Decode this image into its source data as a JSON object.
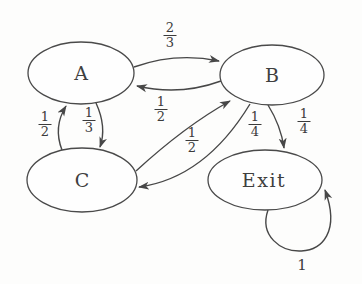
{
  "diagram": {
    "type": "markov-chain-state-diagram",
    "background_color": "#fdfdfc",
    "ink_color": "#474747",
    "nodes": [
      {
        "id": "A",
        "label": "A"
      },
      {
        "id": "B",
        "label": "B"
      },
      {
        "id": "C",
        "label": "C"
      },
      {
        "id": "Exit",
        "label": "Exit"
      }
    ],
    "edges": [
      {
        "from": "A",
        "to": "B",
        "probability": "2/3",
        "num": "2",
        "den": "3"
      },
      {
        "from": "B",
        "to": "A",
        "probability": "1/2",
        "num": "1",
        "den": "2"
      },
      {
        "from": "C",
        "to": "A",
        "probability": "1/2",
        "num": "1",
        "den": "2"
      },
      {
        "from": "A",
        "to": "C",
        "probability": "1/3",
        "num": "1",
        "den": "3"
      },
      {
        "from": "C",
        "to": "B",
        "probability": "1/2",
        "num": "1",
        "den": "2"
      },
      {
        "from": "B",
        "to": "C",
        "probability": "1/4",
        "num": "1",
        "den": "4"
      },
      {
        "from": "B",
        "to": "Exit",
        "probability": "1/4",
        "num": "1",
        "den": "4"
      },
      {
        "from": "Exit",
        "to": "Exit",
        "probability": "1"
      }
    ]
  }
}
